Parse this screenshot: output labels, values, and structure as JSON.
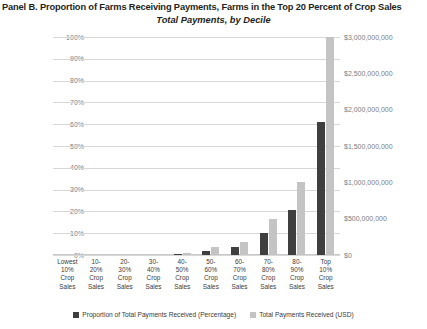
{
  "header": {
    "panel_title": "Panel B. Proportion of Farms Receiving Payments, Farms in the Top 20 Percent of Crop Sales",
    "chart_subtitle": "Total Payments, by Decile"
  },
  "legend": {
    "pct_label": "Proportion of Total Payments Received (Percentage)",
    "usd_label": "Total Payments Received (USD)"
  },
  "colors": {
    "pct_bar": "#3f3f3f",
    "usd_bar": "#c4c4c4",
    "gridline": "#d8d8d8",
    "text": "#231f20",
    "axis_text": "#7d7d7d"
  },
  "chart_data": {
    "type": "bar",
    "title": "Total Payments, by Decile",
    "xlabel": "",
    "ylabel": "",
    "grid": true,
    "legend_position": "bottom",
    "categories": [
      "Lowest 10% Crop Sales",
      "10-20% Crop Sales",
      "20-30% Crop Sales",
      "30-40% Crop Sales",
      "40-50% Crop Sales",
      "50-60% Crop Sales",
      "60-70% Crop Sales",
      "70-80% Crop Sales",
      "80-90% Crop Sales",
      "Top 10% Crop Sales"
    ],
    "category_lines": [
      [
        "Lowest",
        "10%",
        "Crop",
        "Sales"
      ],
      [
        "10-",
        "20%",
        "Crop",
        "Sales"
      ],
      [
        "20-",
        "30%",
        "Crop",
        "Sales"
      ],
      [
        "30-",
        "40%",
        "Crop",
        "Sales"
      ],
      [
        "40-",
        "50%",
        "Crop",
        "Sales"
      ],
      [
        "50-",
        "60%",
        "Crop",
        "Sales"
      ],
      [
        "60-",
        "70%",
        "Crop",
        "Sales"
      ],
      [
        "70-",
        "80%",
        "Crop",
        "Sales"
      ],
      [
        "80-",
        "90%",
        "Crop",
        "Sales"
      ],
      [
        "Top",
        "10%",
        "Crop",
        "Sales"
      ]
    ],
    "series": [
      {
        "name": "Proportion of Total Payments Received (Percentage)",
        "axis": "left",
        "color": "#3f3f3f",
        "values": [
          0,
          0,
          0,
          0,
          0.5,
          2,
          3.5,
          10,
          20.5,
          61
        ]
      },
      {
        "name": "Total Payments Received (USD)",
        "axis": "right",
        "color": "#c4c4c4",
        "values": [
          0,
          0,
          0,
          0,
          30000000,
          110000000,
          185000000,
          500000000,
          1010000000,
          3000000000
        ]
      }
    ],
    "ylim": [
      0,
      100
    ],
    "yticks": [
      0,
      10,
      20,
      30,
      40,
      50,
      60,
      70,
      80,
      90,
      100
    ],
    "ytick_labels": [
      "0%",
      "10%",
      "20%",
      "30%",
      "40%",
      "50%",
      "60%",
      "70%",
      "80%",
      "90%",
      "100%"
    ],
    "y2lim": [
      0,
      3000000000
    ],
    "y2ticks": [
      0,
      500000000,
      1000000000,
      1500000000,
      2000000000,
      2500000000,
      3000000000
    ],
    "y2tick_labels": [
      "$0",
      "$500,000,000",
      "$1,000,000,000",
      "$1,500,000,000",
      "$2,000,000,000",
      "$2,500,000,000",
      "$3,000,000,000"
    ]
  }
}
